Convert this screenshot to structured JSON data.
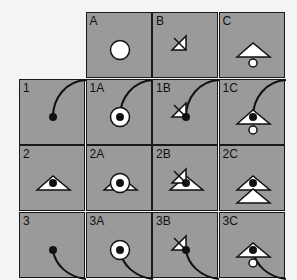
{
  "grid": {
    "columns": [
      "",
      "A",
      "B",
      "C"
    ],
    "rows": [
      "",
      "1",
      "2",
      "3"
    ],
    "cells": [
      {
        "id": "A",
        "label": "A",
        "col": 1,
        "row": 0,
        "shapes": [
          "circle-large"
        ]
      },
      {
        "id": "B",
        "label": "B",
        "col": 2,
        "row": 0,
        "shapes": [
          "half-triangle-with-x"
        ]
      },
      {
        "id": "C",
        "label": "C",
        "col": 3,
        "row": 0,
        "shapes": [
          "triangle",
          "small-circle-below"
        ]
      },
      {
        "id": "1",
        "label": "1",
        "col": 0,
        "row": 1,
        "shapes": [
          "arc-top-right",
          "dot"
        ]
      },
      {
        "id": "1A",
        "label": "1A",
        "col": 1,
        "row": 1,
        "shapes": [
          "arc-top-right",
          "circle-large",
          "dot"
        ]
      },
      {
        "id": "1B",
        "label": "1B",
        "col": 2,
        "row": 1,
        "shapes": [
          "arc-top-right",
          "half-triangle-with-x",
          "dot"
        ]
      },
      {
        "id": "1C",
        "label": "1C",
        "col": 3,
        "row": 1,
        "shapes": [
          "arc-top-right",
          "triangle",
          "small-circle-below",
          "dot"
        ]
      },
      {
        "id": "2",
        "label": "2",
        "col": 0,
        "row": 2,
        "shapes": [
          "triangle",
          "dot"
        ]
      },
      {
        "id": "2A",
        "label": "2A",
        "col": 1,
        "row": 2,
        "shapes": [
          "triangle",
          "circle-large",
          "dot"
        ]
      },
      {
        "id": "2B",
        "label": "2B",
        "col": 2,
        "row": 2,
        "shapes": [
          "triangle",
          "half-triangle-with-x",
          "dot"
        ]
      },
      {
        "id": "2C",
        "label": "2C",
        "col": 3,
        "row": 2,
        "shapes": [
          "triangle",
          "triangle-lower",
          "dot"
        ]
      },
      {
        "id": "3",
        "label": "3",
        "col": 0,
        "row": 3,
        "shapes": [
          "arc-bottom-right",
          "dot"
        ]
      },
      {
        "id": "3A",
        "label": "3A",
        "col": 1,
        "row": 3,
        "shapes": [
          "arc-bottom-right",
          "circle-large",
          "dot"
        ]
      },
      {
        "id": "3B",
        "label": "3B",
        "col": 2,
        "row": 3,
        "shapes": [
          "arc-bottom-right",
          "half-triangle-with-x",
          "dot"
        ]
      },
      {
        "id": "3C",
        "label": "3C",
        "col": 3,
        "row": 3,
        "shapes": [
          "arc-bottom-right",
          "triangle",
          "small-circle-below",
          "dot"
        ]
      }
    ]
  },
  "colors": {
    "cell_fill": "#9a9a9a",
    "border": "#1a1a1a",
    "shape_fill": "#ffffff",
    "dot": "#111111"
  }
}
